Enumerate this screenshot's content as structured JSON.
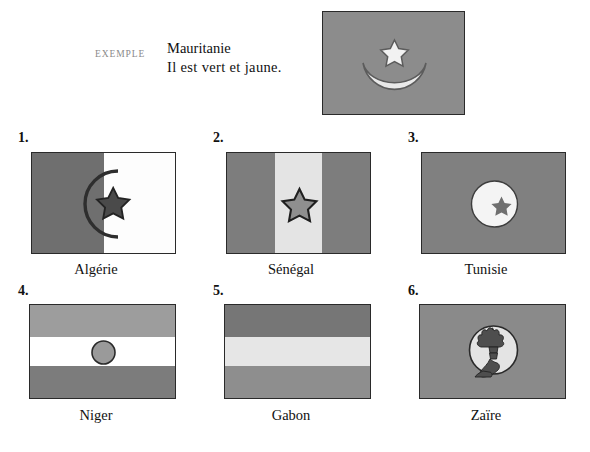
{
  "page": {
    "background_color": "#ffffff",
    "ink_color": "#111111"
  },
  "example": {
    "tag": "EXEMPLE",
    "country": "Mauritanie",
    "sentence": "Il est vert et jaune.",
    "tag_color": "#8a8a8a",
    "flag": {
      "name": "Mauritanie",
      "field_color": "#8c8c8c",
      "emblem": "crescent-and-star",
      "emblem_color": "#e8e8e8"
    }
  },
  "items": [
    {
      "number": "1.",
      "caption": "Algérie",
      "flag": {
        "name": "Algérie",
        "layout": "vertical-halves",
        "colors": [
          "#6f6f6f",
          "#fdfdfd"
        ],
        "emblem": "crescent-and-star-outline",
        "emblem_color": "#3a3a3a"
      }
    },
    {
      "number": "2.",
      "caption": "Sénégal",
      "flag": {
        "name": "Sénégal",
        "layout": "vertical-triband",
        "colors": [
          "#7d7d7d",
          "#e4e4e4",
          "#7d7d7d"
        ],
        "emblem": "five-pointed-star",
        "emblem_color": "#8a8a8a"
      }
    },
    {
      "number": "3.",
      "caption": "Tunisie",
      "flag": {
        "name": "Tunisie",
        "layout": "solid",
        "colors": [
          "#808080"
        ],
        "emblem": "disc-with-crescent-and-star",
        "emblem_color": "#f4f4f4"
      }
    },
    {
      "number": "4.",
      "caption": "Niger",
      "flag": {
        "name": "Niger",
        "layout": "horizontal-triband",
        "colors": [
          "#9d9d9d",
          "#ffffff",
          "#7c7c7c"
        ],
        "emblem": "circle-disc",
        "emblem_color": "#9a9a9a"
      }
    },
    {
      "number": "5.",
      "caption": "Gabon",
      "flag": {
        "name": "Gabon",
        "layout": "horizontal-triband",
        "colors": [
          "#767676",
          "#e6e6e6",
          "#8e8e8e"
        ],
        "emblem": "none",
        "emblem_color": ""
      }
    },
    {
      "number": "6.",
      "caption": "Zaïre",
      "flag": {
        "name": "Zaïre",
        "layout": "solid",
        "colors": [
          "#8a8a8a"
        ],
        "emblem": "arm-holding-flaming-torch-in-disc",
        "emblem_color": "#e4e4e4"
      }
    }
  ]
}
